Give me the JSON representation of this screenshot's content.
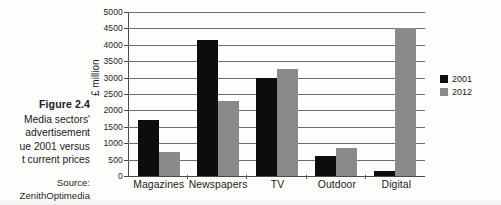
{
  "figure": {
    "number_label": "Figure 2.4",
    "caption_lines": [
      "Media sectors'",
      "advertisement",
      "ue 2001 versus",
      "t current prices"
    ],
    "source_label": "Source:",
    "source_name": "ZenithOptimedia"
  },
  "legend": {
    "position": "right",
    "entries": [
      {
        "label": "2001",
        "color": "#0d0d0d"
      },
      {
        "label": "2012",
        "color": "#8a8a8a"
      }
    ]
  },
  "chart_data": {
    "type": "bar",
    "title": "",
    "subtitle": "",
    "xlabel": "",
    "ylabel": "£ million",
    "ylim": [
      0,
      5000
    ],
    "ytick_step": 500,
    "ytick_labels": [
      "0",
      "500",
      "1000",
      "1500",
      "2000",
      "2500",
      "3000",
      "3500",
      "4000",
      "4500",
      "5000"
    ],
    "grid": true,
    "legend_position": "right",
    "categories": [
      "Magazines",
      "Newspapers",
      "TV",
      "Outdoor",
      "Digital"
    ],
    "series": [
      {
        "name": "2001",
        "color": "#0d0d0d",
        "values": [
          1700,
          4150,
          3000,
          610,
          140
        ]
      },
      {
        "name": "2012",
        "color": "#8a8a8a",
        "values": [
          730,
          2280,
          3250,
          850,
          4500
        ]
      }
    ]
  }
}
